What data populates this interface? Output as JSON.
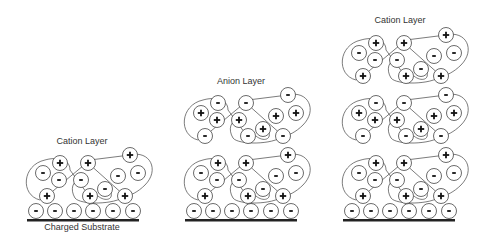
{
  "labels": {
    "panel1_top": "Cation Layer",
    "panel1_bottom": "Charged Substrate",
    "panel2_top": "Anion Layer",
    "panel3_top": "Cation Layer"
  },
  "colors": {
    "stroke": "#444444",
    "substrate": "#222222",
    "background": "#ffffff"
  },
  "symbols": {
    "positive": "+",
    "negative": "-"
  },
  "panels": [
    {
      "name": "panel-1",
      "dx": 0,
      "layers": [
        "cation"
      ],
      "label_key": "panel1_top"
    },
    {
      "name": "panel-2",
      "dx": 158,
      "layers": [
        "cation",
        "anion"
      ],
      "label_key": "panel2_top"
    },
    {
      "name": "panel-3",
      "dx": 316,
      "layers": [
        "cation",
        "anion",
        "cation"
      ],
      "label_key": "panel3_top"
    }
  ],
  "substrate_ions": [
    {
      "x": 36,
      "y": 211,
      "q": "-"
    },
    {
      "x": 55,
      "y": 211,
      "q": "-"
    },
    {
      "x": 74,
      "y": 211,
      "q": "-"
    },
    {
      "x": 93,
      "y": 211,
      "q": "-"
    },
    {
      "x": 113,
      "y": 211,
      "q": "-"
    },
    {
      "x": 133,
      "y": 211,
      "q": "-"
    }
  ],
  "layer_ions": [
    {
      "x": 60,
      "y": 163,
      "q": "+"
    },
    {
      "x": 88,
      "y": 163,
      "q": "+"
    },
    {
      "x": 130,
      "y": 155,
      "q": "+"
    },
    {
      "x": 43,
      "y": 173,
      "q": "-"
    },
    {
      "x": 59,
      "y": 180,
      "q": "-"
    },
    {
      "x": 81,
      "y": 180,
      "q": "-"
    },
    {
      "x": 118,
      "y": 176,
      "q": "-"
    },
    {
      "x": 138,
      "y": 173,
      "q": "-"
    },
    {
      "x": 105,
      "y": 189,
      "q": "-"
    },
    {
      "x": 47,
      "y": 196,
      "q": "+"
    },
    {
      "x": 90,
      "y": 196,
      "q": "+"
    },
    {
      "x": 125,
      "y": 196,
      "q": "+"
    }
  ]
}
